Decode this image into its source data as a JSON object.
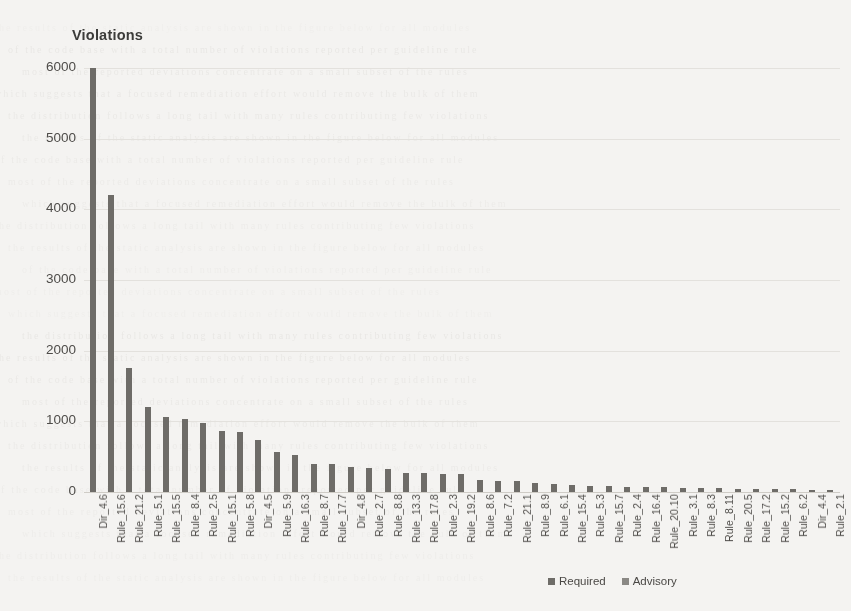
{
  "chart_data": {
    "type": "bar",
    "title": "Violations",
    "xlabel": "",
    "ylabel": "Violations",
    "ylim": [
      0,
      6000
    ],
    "yticks": [
      0,
      1000,
      2000,
      3000,
      4000,
      5000,
      6000
    ],
    "grid": true,
    "legend_position": "bottom-right",
    "categories": [
      "Dir_4.6",
      "Rule_15.6",
      "Rule_21.2",
      "Rule_5.1",
      "Rule_15.5",
      "Rule_8.4",
      "Rule_2.5",
      "Rule_15.1",
      "Rule_5.8",
      "Dir_4.5",
      "Rule_5.9",
      "Rule_16.3",
      "Rule_8.7",
      "Rule_17.7",
      "Dir_4.8",
      "Rule_2.7",
      "Rule_8.8",
      "Rule_13.3",
      "Rule_17.8",
      "Rule_2.3",
      "Rule_19.2",
      "Rule_8.6",
      "Rule_7.2",
      "Rule_21.1",
      "Rule_8.9",
      "Rule_6.1",
      "Rule_15.4",
      "Rule_5.3",
      "Rule_15.7",
      "Rule_2.4",
      "Rule_16.4",
      "Rule_20.10",
      "Rule_3.1",
      "Rule_8.3",
      "Rule_8.11",
      "Rule_20.5",
      "Rule_17.2",
      "Rule_15.2",
      "Rule_6.2",
      "Dir_4.4",
      "Rule_2.1"
    ],
    "values": [
      6000,
      4200,
      1760,
      1200,
      1060,
      1030,
      980,
      870,
      850,
      740,
      570,
      520,
      400,
      390,
      350,
      340,
      330,
      270,
      265,
      255,
      250,
      165,
      155,
      150,
      130,
      120,
      95,
      92,
      90,
      75,
      72,
      70,
      55,
      52,
      50,
      48,
      45,
      42,
      38,
      35,
      30
    ],
    "series_type": [
      "Required",
      "Required",
      "Required",
      "Required",
      "Required",
      "Required",
      "Required",
      "Required",
      "Required",
      "Required",
      "Required",
      "Required",
      "Required",
      "Required",
      "Required",
      "Required",
      "Required",
      "Required",
      "Required",
      "Required",
      "Required",
      "Required",
      "Required",
      "Required",
      "Required",
      "Required",
      "Required",
      "Required",
      "Required",
      "Required",
      "Required",
      "Required",
      "Required",
      "Required",
      "Required",
      "Required",
      "Required",
      "Required",
      "Required",
      "Required",
      "Required"
    ],
    "legend": [
      {
        "label": "Required",
        "color": "#6e6c68"
      },
      {
        "label": "Advisory",
        "color": "#8a8884"
      }
    ]
  },
  "legend": {
    "required_label": "Required",
    "advisory_label": "Advisory"
  },
  "colors": {
    "required": "#6e6c68",
    "advisory": "#8a8884",
    "grid": "#e3e1dd",
    "text": "#4e4c49",
    "background": "#f4f3f1"
  },
  "background_noise": [
    "the  results  of  the  static  analysis  are  shown  in  the  figure  below  for  all  modules",
    "of  the  code  base  with  a  total  number  of  violations  reported  per  guideline  rule",
    "most  of  the  reported  deviations  concentrate  on  a  small  subset  of  the  rules",
    "which  suggests  that  a  focused  remediation  effort  would  remove  the  bulk  of  them",
    "the  distribution  follows  a  long  tail  with  many  rules  contributing  few  violations"
  ]
}
